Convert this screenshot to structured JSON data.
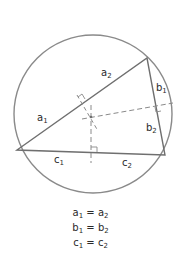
{
  "diagram": {
    "colors": {
      "stroke": "#8a8a8a",
      "triangle": "#6f6f6f",
      "text": "#2a2a2a",
      "background": "#ffffff"
    },
    "circle": {
      "cx": 93,
      "cy": 114,
      "r": 79
    },
    "vertices": {
      "A": {
        "x": 17,
        "y": 150
      },
      "B": {
        "x": 147,
        "y": 58
      },
      "C": {
        "x": 165,
        "y": 155
      }
    },
    "circumcenter": {
      "x": 91,
      "y": 117
    },
    "labels": {
      "a1": {
        "base": "a",
        "sub": "1"
      },
      "a2": {
        "base": "a",
        "sub": "2"
      },
      "b1": {
        "base": "b",
        "sub": "1"
      },
      "b2": {
        "base": "b",
        "sub": "2"
      },
      "c1": {
        "base": "c",
        "sub": "1"
      },
      "c2": {
        "base": "c",
        "sub": "2"
      }
    },
    "equations": [
      {
        "lhs": "a",
        "lhs_sub": "1",
        "op": "=",
        "rhs": "a",
        "rhs_sub": "2"
      },
      {
        "lhs": "b",
        "lhs_sub": "1",
        "op": "=",
        "rhs": "b",
        "rhs_sub": "2"
      },
      {
        "lhs": "c",
        "lhs_sub": "1",
        "op": "=",
        "rhs": "c",
        "rhs_sub": "2"
      }
    ]
  }
}
